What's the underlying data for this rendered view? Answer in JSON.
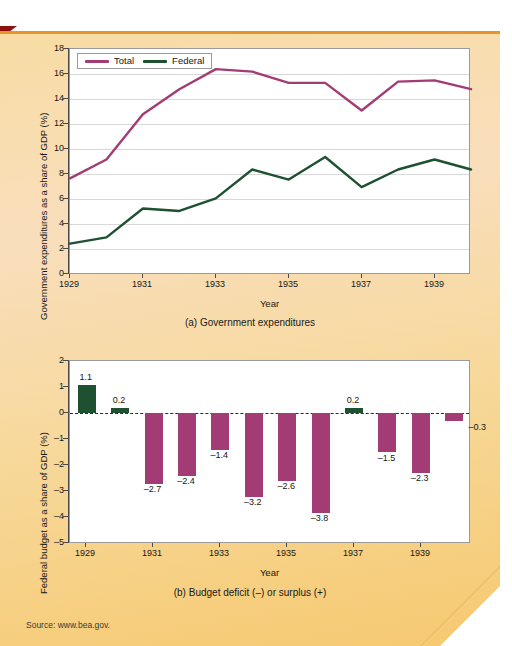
{
  "page": {
    "source_note": "Source: www.bea.gov.",
    "accent_orange": "#e79528",
    "background_tan": "#f7dca0",
    "corner_marker_color": "#8c1210"
  },
  "figure_a": {
    "caption": "(a) Government expenditures",
    "legend": [
      {
        "label": "Total",
        "color": "#a33b74"
      },
      {
        "label": "Federal",
        "color": "#1d5132"
      }
    ],
    "chart_data": {
      "type": "line",
      "title": "(a) Government expenditures",
      "xlabel": "Year",
      "ylabel": "Government expenditures as a share of GDP (%)",
      "x": [
        1929,
        1930,
        1931,
        1932,
        1933,
        1934,
        1935,
        1936,
        1937,
        1938,
        1939,
        1940
      ],
      "xticklabels": [
        "1929",
        "1931",
        "1933",
        "1935",
        "1937",
        "1939"
      ],
      "xticks": [
        1929,
        1931,
        1933,
        1935,
        1937,
        1939
      ],
      "yticks": [
        0,
        2,
        4,
        6,
        8,
        10,
        12,
        14,
        16,
        18
      ],
      "xlim": [
        1929,
        1940
      ],
      "ylim": [
        0,
        18
      ],
      "grid": true,
      "legend_position": "top-left",
      "series": [
        {
          "name": "Total",
          "color": "#a33b74",
          "values": [
            7.7,
            9.2,
            12.8,
            14.8,
            16.4,
            16.2,
            15.3,
            15.3,
            13.1,
            15.4,
            15.5,
            14.8
          ]
        },
        {
          "name": "Federal",
          "color": "#1d5132",
          "values": [
            2.5,
            3.0,
            5.3,
            5.1,
            6.1,
            8.4,
            7.6,
            9.4,
            7.0,
            8.4,
            9.2,
            8.4
          ]
        }
      ]
    }
  },
  "figure_b": {
    "caption": "(b) Budget deficit (–) or surplus (+)",
    "chart_data": {
      "type": "bar",
      "title": "(b) Budget deficit (–) or surplus (+)",
      "xlabel": "Year",
      "ylabel": "Federal budget as a share of GDP (%)",
      "categories": [
        1929,
        1930,
        1931,
        1932,
        1933,
        1934,
        1935,
        1936,
        1937,
        1938,
        1939,
        1940
      ],
      "xticklabels": [
        "1929",
        "1931",
        "1933",
        "1935",
        "1937",
        "1939"
      ],
      "xticks": [
        1929,
        1931,
        1933,
        1935,
        1937,
        1939
      ],
      "yticks": [
        2,
        1,
        0,
        -1,
        -2,
        -3,
        -4,
        -5
      ],
      "yticklabels": [
        "2",
        "1",
        "0",
        "–1",
        "–2",
        "–3",
        "–4",
        "–5"
      ],
      "ylim": [
        -5,
        2
      ],
      "grid": false,
      "zero_reference_line": true,
      "positive_color": "#1d5132",
      "negative_color": "#a33b74",
      "values": [
        1.1,
        0.2,
        -2.7,
        -2.4,
        -1.4,
        -3.2,
        -2.6,
        -3.8,
        0.2,
        -1.5,
        -2.3,
        -0.3
      ],
      "data_labels": [
        "1.1",
        "0.2",
        "–2.7",
        "–2.4",
        "–1.4",
        "–3.2",
        "–2.6",
        "–3.8",
        "0.2",
        "–1.5",
        "–2.3",
        "–0.3"
      ]
    }
  }
}
